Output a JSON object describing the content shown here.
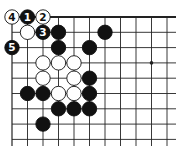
{
  "diagram": {
    "type": "go-board-fragment",
    "grid": {
      "columns": 11,
      "rows": 9,
      "origin_x": 12,
      "origin_y": 17,
      "spacing_x": 15.5,
      "spacing_y": 15.3,
      "line_extend_right": 176,
      "line_extend_bottom": 146,
      "edges": [
        "top",
        "left"
      ]
    },
    "colors": {
      "line": "#222222",
      "black_stone": "#111111",
      "white_stone": "#ffffff",
      "background": "#ffffff"
    },
    "hoshi": [
      {
        "col": 9,
        "row": 3
      }
    ],
    "stones": [
      {
        "col": 0,
        "row": 0,
        "color": "white",
        "label": "4"
      },
      {
        "col": 1,
        "row": 0,
        "color": "black",
        "label": "1"
      },
      {
        "col": 2,
        "row": 0,
        "color": "white",
        "label": "2"
      },
      {
        "col": 1,
        "row": 1,
        "color": "white",
        "label": ""
      },
      {
        "col": 2,
        "row": 1,
        "color": "black",
        "label": "3"
      },
      {
        "col": 3,
        "row": 1,
        "color": "black",
        "label": ""
      },
      {
        "col": 6,
        "row": 1,
        "color": "black",
        "label": ""
      },
      {
        "col": 0,
        "row": 2,
        "color": "black",
        "label": "5"
      },
      {
        "col": 3,
        "row": 2,
        "color": "black",
        "label": ""
      },
      {
        "col": 5,
        "row": 2,
        "color": "black",
        "label": ""
      },
      {
        "col": 2,
        "row": 3,
        "color": "white",
        "label": ""
      },
      {
        "col": 3,
        "row": 3,
        "color": "white",
        "label": ""
      },
      {
        "col": 4,
        "row": 3,
        "color": "white",
        "label": ""
      },
      {
        "col": 2,
        "row": 4,
        "color": "white",
        "label": ""
      },
      {
        "col": 4,
        "row": 4,
        "color": "white",
        "label": ""
      },
      {
        "col": 5,
        "row": 4,
        "color": "black",
        "label": ""
      },
      {
        "col": 1,
        "row": 5,
        "color": "black",
        "label": ""
      },
      {
        "col": 2,
        "row": 5,
        "color": "black",
        "label": ""
      },
      {
        "col": 3,
        "row": 5,
        "color": "white",
        "label": ""
      },
      {
        "col": 4,
        "row": 5,
        "color": "white",
        "label": ""
      },
      {
        "col": 5,
        "row": 5,
        "color": "black",
        "label": ""
      },
      {
        "col": 3,
        "row": 6,
        "color": "black",
        "label": ""
      },
      {
        "col": 4,
        "row": 6,
        "color": "black",
        "label": ""
      },
      {
        "col": 5,
        "row": 6,
        "color": "black",
        "label": ""
      },
      {
        "col": 2,
        "row": 7,
        "color": "black",
        "label": ""
      }
    ]
  }
}
